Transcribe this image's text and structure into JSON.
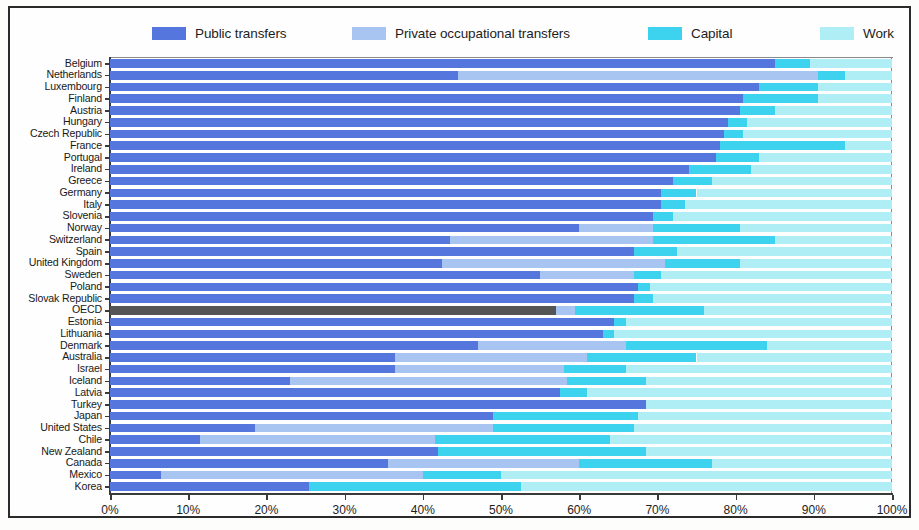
{
  "legend": {
    "items": [
      {
        "label": "Public transfers",
        "color": "#5577dd",
        "key": "public"
      },
      {
        "label": "Private occupational transfers",
        "color": "#a8c4f0",
        "key": "private"
      },
      {
        "label": "Capital",
        "color": "#3dd2ee",
        "key": "capital"
      },
      {
        "label": "Work",
        "color": "#aeeef4",
        "key": "work"
      }
    ]
  },
  "axis": {
    "x_ticks": [
      "0%",
      "10%",
      "20%",
      "30%",
      "40%",
      "50%",
      "60%",
      "70%",
      "80%",
      "90%",
      "100%"
    ],
    "x_min": 0,
    "x_max": 100
  },
  "highlight": {
    "category": "OECD",
    "color": "#555555"
  },
  "chart_data": {
    "type": "bar",
    "orientation": "horizontal",
    "stacked": true,
    "title": "",
    "xlabel": "",
    "ylabel": "",
    "xlim": [
      0,
      100
    ],
    "grid": false,
    "legend_position": "top",
    "series": [
      {
        "name": "Public transfers",
        "color": "#5577dd"
      },
      {
        "name": "Private occupational transfers",
        "color": "#a8c4f0"
      },
      {
        "name": "Capital",
        "color": "#3dd2ee"
      },
      {
        "name": "Work",
        "color": "#aeeef4"
      }
    ],
    "categories": [
      "Belgium",
      "Netherlands",
      "Luxembourg",
      "Finland",
      "Austria",
      "Hungary",
      "Czech Republic",
      "France",
      "Portugal",
      "Ireland",
      "Greece",
      "Germany",
      "Italy",
      "Slovenia",
      "Norway",
      "Switzerland",
      "Spain",
      "United Kingdom",
      "Sweden",
      "Poland",
      "Slovak Republic",
      "OECD",
      "Estonia",
      "Lithuania",
      "Denmark",
      "Australia",
      "Israel",
      "Iceland",
      "Latvia",
      "Turkey",
      "Japan",
      "United States",
      "Chile",
      "New Zealand",
      "Canada",
      "Mexico",
      "Korea"
    ],
    "rows": [
      {
        "category": "Belgium",
        "public": 85.0,
        "private": 0.0,
        "capital": 4.5,
        "work": 10.5
      },
      {
        "category": "Netherlands",
        "public": 44.5,
        "private": 46.0,
        "capital": 3.5,
        "work": 6.0
      },
      {
        "category": "Luxembourg",
        "public": 83.0,
        "private": 0.0,
        "capital": 7.5,
        "work": 9.5
      },
      {
        "category": "Finland",
        "public": 81.0,
        "private": 0.0,
        "capital": 9.5,
        "work": 9.5
      },
      {
        "category": "Austria",
        "public": 80.5,
        "private": 0.0,
        "capital": 4.5,
        "work": 15.0
      },
      {
        "category": "Hungary",
        "public": 79.0,
        "private": 0.0,
        "capital": 2.5,
        "work": 18.5
      },
      {
        "category": "Czech Republic",
        "public": 78.5,
        "private": 0.0,
        "capital": 2.5,
        "work": 19.0
      },
      {
        "category": "France",
        "public": 78.0,
        "private": 0.0,
        "capital": 16.0,
        "work": 6.0
      },
      {
        "category": "Portugal",
        "public": 77.5,
        "private": 0.0,
        "capital": 5.5,
        "work": 17.0
      },
      {
        "category": "Ireland",
        "public": 74.0,
        "private": 0.0,
        "capital": 8.0,
        "work": 18.0
      },
      {
        "category": "Greece",
        "public": 72.0,
        "private": 0.0,
        "capital": 5.0,
        "work": 23.0
      },
      {
        "category": "Germany",
        "public": 70.5,
        "private": 0.0,
        "capital": 4.5,
        "work": 25.0
      },
      {
        "category": "Italy",
        "public": 70.5,
        "private": 0.0,
        "capital": 3.0,
        "work": 26.5
      },
      {
        "category": "Slovenia",
        "public": 69.5,
        "private": 0.0,
        "capital": 2.5,
        "work": 28.0
      },
      {
        "category": "Norway",
        "public": 60.0,
        "private": 9.5,
        "capital": 11.0,
        "work": 19.5
      },
      {
        "category": "Switzerland",
        "public": 43.5,
        "private": 26.0,
        "capital": 15.5,
        "work": 15.0
      },
      {
        "category": "Spain",
        "public": 67.0,
        "private": 0.0,
        "capital": 5.5,
        "work": 27.5
      },
      {
        "category": "United Kingdom",
        "public": 42.5,
        "private": 28.5,
        "capital": 9.5,
        "work": 19.5
      },
      {
        "category": "Sweden",
        "public": 55.0,
        "private": 12.0,
        "capital": 3.5,
        "work": 29.5
      },
      {
        "category": "Poland",
        "public": 67.5,
        "private": 0.0,
        "capital": 1.5,
        "work": 31.0
      },
      {
        "category": "Slovak Republic",
        "public": 67.0,
        "private": 0.0,
        "capital": 2.5,
        "work": 30.5
      },
      {
        "category": "OECD",
        "public": 57.0,
        "private": 2.5,
        "capital": 16.5,
        "work": 24.0
      },
      {
        "category": "Estonia",
        "public": 64.5,
        "private": 0.0,
        "capital": 1.5,
        "work": 34.0
      },
      {
        "category": "Lithuania",
        "public": 63.0,
        "private": 0.0,
        "capital": 1.5,
        "work": 35.5
      },
      {
        "category": "Denmark",
        "public": 47.0,
        "private": 19.0,
        "capital": 18.0,
        "work": 16.0
      },
      {
        "category": "Australia",
        "public": 36.5,
        "private": 24.5,
        "capital": 14.0,
        "work": 25.0
      },
      {
        "category": "Israel",
        "public": 36.5,
        "private": 21.5,
        "capital": 8.0,
        "work": 34.0
      },
      {
        "category": "Iceland",
        "public": 23.0,
        "private": 35.5,
        "capital": 10.0,
        "work": 31.5
      },
      {
        "category": "Latvia",
        "public": 57.5,
        "private": 0.0,
        "capital": 3.5,
        "work": 39.0
      },
      {
        "category": "Turkey",
        "public": 68.5,
        "private": 0.0,
        "capital": 0.0,
        "work": 31.5
      },
      {
        "category": "Japan",
        "public": 49.0,
        "private": 0.0,
        "capital": 18.5,
        "work": 32.5
      },
      {
        "category": "United States",
        "public": 18.5,
        "private": 30.5,
        "capital": 18.0,
        "work": 33.0
      },
      {
        "category": "Chile",
        "public": 11.5,
        "private": 30.0,
        "capital": 22.5,
        "work": 36.0
      },
      {
        "category": "New Zealand",
        "public": 42.0,
        "private": 0.0,
        "capital": 26.5,
        "work": 31.5
      },
      {
        "category": "Canada",
        "public": 35.5,
        "private": 24.5,
        "capital": 17.0,
        "work": 23.0
      },
      {
        "category": "Mexico",
        "public": 6.5,
        "private": 33.5,
        "capital": 10.0,
        "work": 50.0
      },
      {
        "category": "Korea",
        "public": 25.5,
        "private": 0.0,
        "capital": 27.0,
        "work": 47.5
      }
    ]
  }
}
